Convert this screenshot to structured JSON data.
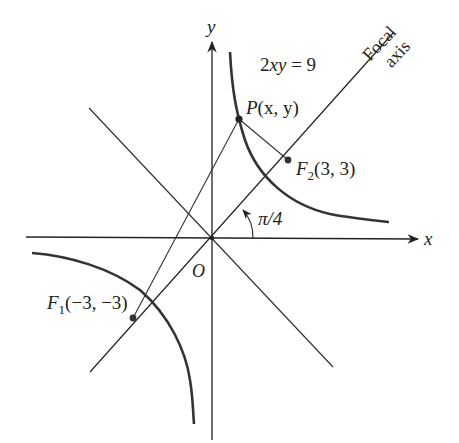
{
  "figure": {
    "equation": "2xy = 9",
    "axes": {
      "x_label": "x",
      "y_label": "y",
      "origin_label": "O"
    },
    "focal_axis_label": {
      "line1": "Focal",
      "line2": "axis"
    },
    "angle_label": "π/4",
    "points": {
      "P": {
        "name": "P",
        "coords": "(x, y)"
      },
      "F1": {
        "name": "F",
        "subscript": "1",
        "coords": "(−3, −3)"
      },
      "F2": {
        "name": "F",
        "subscript": "2",
        "coords": "(3, 3)"
      }
    },
    "colors": {
      "stroke": "#222222",
      "curve": "#333333",
      "background": "#ffffff"
    }
  }
}
